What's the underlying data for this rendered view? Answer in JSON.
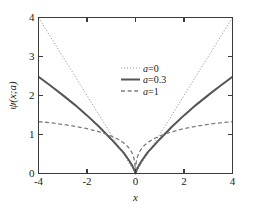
{
  "chart_data": {
    "type": "line",
    "title": "",
    "xlabel": "x",
    "ylabel": "ψ(x;a)",
    "xlim": [
      -4,
      4
    ],
    "ylim": [
      0,
      4
    ],
    "xticks": [
      -4,
      -2,
      0,
      2,
      4
    ],
    "xtick_labels": [
      "-4",
      "-2",
      "0",
      "2",
      "4"
    ],
    "yticks": [
      0,
      1,
      2,
      3,
      4
    ],
    "ytick_labels": [
      "0",
      "1",
      "2",
      "3",
      "4"
    ],
    "grid": false,
    "legend_position": "upper-center",
    "series": [
      {
        "name": "a=0",
        "label_prefix": "a",
        "label_suffix": "=0",
        "style": "dotted",
        "color": "#9a9a9a",
        "width": 1.0,
        "x": [
          -4,
          -3.5,
          -3,
          -2.5,
          -2,
          -1.5,
          -1,
          -0.5,
          -0.25,
          0,
          0.25,
          0.5,
          1,
          1.5,
          2,
          2.5,
          3,
          3.5,
          4
        ],
        "y": [
          4,
          3.5,
          3,
          2.5,
          2,
          1.5,
          1,
          0.5,
          0.25,
          0,
          0.25,
          0.5,
          1,
          1.5,
          2,
          2.5,
          3,
          3.5,
          4
        ]
      },
      {
        "name": "a=0.3",
        "label_prefix": "a",
        "label_suffix": "=0.3",
        "style": "solid",
        "color": "#555555",
        "width": 2.0,
        "x": [
          -4,
          -3.5,
          -3,
          -2.5,
          -2,
          -1.5,
          -1,
          -0.75,
          -0.5,
          -0.35,
          -0.25,
          -0.15,
          -0.08,
          -0.03,
          0,
          0.03,
          0.08,
          0.15,
          0.25,
          0.35,
          0.5,
          0.75,
          1,
          1.5,
          2,
          2.5,
          3,
          3.5,
          4
        ],
        "y": [
          2.48,
          2.25,
          2.01,
          1.76,
          1.49,
          1.2,
          0.88,
          0.71,
          0.54,
          0.41,
          0.32,
          0.22,
          0.13,
          0.06,
          0,
          0.06,
          0.13,
          0.22,
          0.32,
          0.41,
          0.54,
          0.71,
          0.88,
          1.2,
          1.49,
          1.76,
          2.01,
          2.25,
          2.48
        ]
      },
      {
        "name": "a=1",
        "label_prefix": "a",
        "label_suffix": "=1",
        "style": "dashed",
        "color": "#7d7d7d",
        "width": 1.3,
        "x": [
          -4,
          -3.5,
          -3,
          -2.5,
          -2,
          -1.5,
          -1,
          -0.75,
          -0.5,
          -0.35,
          -0.25,
          -0.15,
          -0.08,
          -0.03,
          0,
          0.03,
          0.08,
          0.15,
          0.25,
          0.35,
          0.5,
          0.75,
          1,
          1.5,
          2,
          2.5,
          3,
          3.5,
          4
        ],
        "y": [
          1.33,
          1.3,
          1.26,
          1.21,
          1.15,
          1.07,
          0.96,
          0.89,
          0.79,
          0.71,
          0.64,
          0.54,
          0.43,
          0.29,
          0,
          0.29,
          0.43,
          0.54,
          0.64,
          0.71,
          0.79,
          0.89,
          0.96,
          1.07,
          1.15,
          1.21,
          1.26,
          1.3,
          1.33
        ]
      }
    ]
  },
  "legend": {
    "entries": [
      {
        "text": "a=0"
      },
      {
        "text": "a=0.3"
      },
      {
        "text": "a=1"
      }
    ]
  }
}
